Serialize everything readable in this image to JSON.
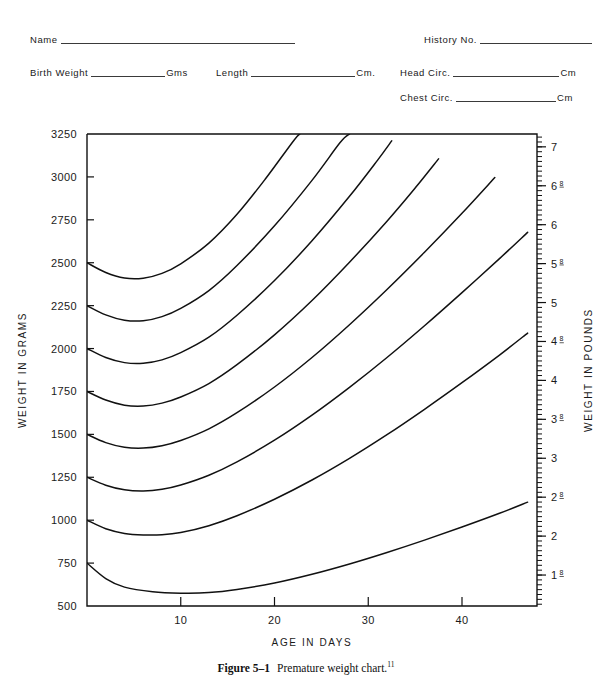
{
  "header_form": {
    "fields": [
      {
        "name": "name",
        "label": "Name",
        "value": "",
        "unit": "",
        "rule_width": 234
      },
      {
        "name": "history-no",
        "label": "History No.",
        "value": "",
        "unit": "",
        "rule_width": 112
      },
      {
        "name": "birth-weight",
        "label": "Birth Weight",
        "value": "",
        "unit": "Gms",
        "rule_width": 74
      },
      {
        "name": "length",
        "label": "Length",
        "value": "",
        "unit": "Cm.",
        "rule_width": 104
      },
      {
        "name": "head-circ",
        "label": "Head Circ.",
        "value": "",
        "unit": "Cm",
        "rule_width": 106
      },
      {
        "name": "chest-circ",
        "label": "Chest Circ.",
        "value": "",
        "unit": "Cm",
        "rule_width": 100
      }
    ]
  },
  "caption": {
    "number": "Figure 5–1",
    "text": "Premature weight chart.",
    "footnote": "11"
  },
  "chart_data": {
    "type": "line",
    "title": "Premature weight chart",
    "xlabel": "AGE IN DAYS",
    "ylabel": "WEIGHT IN GRAMS",
    "y2label": "WEIGHT IN POUNDS",
    "xlim": [
      0,
      48
    ],
    "ylim": [
      500,
      3250
    ],
    "grid": false,
    "legend": "none",
    "xticks": [
      10,
      20,
      30,
      40
    ],
    "xtick_labels": [
      "10",
      "20",
      "30",
      "40"
    ],
    "xtick_minor_step": 2,
    "yticks": [
      500,
      750,
      1000,
      1250,
      1500,
      1750,
      2000,
      2250,
      2500,
      2750,
      3000,
      3250
    ],
    "ytick_labels": [
      "500",
      "750",
      "1000",
      "1250",
      "1500",
      "1750",
      "2000",
      "2250",
      "2500",
      "2750",
      "3000",
      "3250"
    ],
    "y2_ticks_grams": [
      453.6,
      680.4,
      907.2,
      1134,
      1360.8,
      1587.6,
      1814.4,
      2041.2,
      2268,
      2494.8,
      2721.6,
      2948.4,
      3175.2
    ],
    "y2_tick_labels": [
      "1 Lb.",
      "1|8",
      "2",
      "2|8",
      "3",
      "3|8",
      "4",
      "4|8",
      "5",
      "5|8",
      "6",
      "6|8",
      "7"
    ],
    "y2_minor_step_grams": 28.35,
    "series": [
      {
        "name": "birth-weight-750g",
        "birth_weight": 750,
        "points": [
          [
            0,
            750
          ],
          [
            2,
            660
          ],
          [
            4,
            610
          ],
          [
            7,
            583
          ],
          [
            10,
            575
          ],
          [
            13,
            578
          ],
          [
            16,
            596
          ],
          [
            20,
            634
          ],
          [
            24,
            685
          ],
          [
            28,
            745
          ],
          [
            32,
            812
          ],
          [
            36,
            884
          ],
          [
            40,
            960
          ],
          [
            44,
            1040
          ],
          [
            47,
            1105
          ]
        ]
      },
      {
        "name": "birth-weight-1000g",
        "birth_weight": 1000,
        "points": [
          [
            0,
            1000
          ],
          [
            2,
            950
          ],
          [
            4,
            923
          ],
          [
            6,
            914
          ],
          [
            8,
            915
          ],
          [
            10,
            928
          ],
          [
            13,
            968
          ],
          [
            16,
            1026
          ],
          [
            20,
            1122
          ],
          [
            24,
            1234
          ],
          [
            28,
            1360
          ],
          [
            32,
            1498
          ],
          [
            36,
            1646
          ],
          [
            40,
            1801
          ],
          [
            44,
            1962
          ],
          [
            47,
            2090
          ]
        ]
      },
      {
        "name": "birth-weight-1250g",
        "birth_weight": 1250,
        "points": [
          [
            0,
            1250
          ],
          [
            2,
            1204
          ],
          [
            4,
            1177
          ],
          [
            6,
            1170
          ],
          [
            8,
            1180
          ],
          [
            10,
            1205
          ],
          [
            13,
            1262
          ],
          [
            16,
            1340
          ],
          [
            20,
            1466
          ],
          [
            24,
            1612
          ],
          [
            28,
            1774
          ],
          [
            32,
            1948
          ],
          [
            36,
            2133
          ],
          [
            40,
            2326
          ],
          [
            44,
            2524
          ],
          [
            47,
            2677
          ]
        ]
      },
      {
        "name": "birth-weight-1500g",
        "birth_weight": 1500,
        "points": [
          [
            0,
            1500
          ],
          [
            2,
            1452
          ],
          [
            4,
            1425
          ],
          [
            6,
            1420
          ],
          [
            8,
            1434
          ],
          [
            10,
            1464
          ],
          [
            13,
            1532
          ],
          [
            16,
            1626
          ],
          [
            20,
            1776
          ],
          [
            24,
            1948
          ],
          [
            28,
            2139
          ],
          [
            32,
            2344
          ],
          [
            36,
            2561
          ],
          [
            40,
            2788
          ],
          [
            43.5,
            2996
          ]
        ]
      },
      {
        "name": "birth-weight-1750g",
        "birth_weight": 1750,
        "points": [
          [
            0,
            1750
          ],
          [
            2,
            1700
          ],
          [
            4,
            1670
          ],
          [
            6,
            1665
          ],
          [
            8,
            1682
          ],
          [
            10,
            1718
          ],
          [
            13,
            1796
          ],
          [
            16,
            1906
          ],
          [
            20,
            2080
          ],
          [
            24,
            2280
          ],
          [
            28,
            2503
          ],
          [
            32,
            2742
          ],
          [
            35,
            2935
          ],
          [
            37.5,
            3105
          ]
        ]
      },
      {
        "name": "birth-weight-2000g",
        "birth_weight": 2000,
        "points": [
          [
            0,
            2000
          ],
          [
            2,
            1948
          ],
          [
            4,
            1918
          ],
          [
            6,
            1914
          ],
          [
            8,
            1934
          ],
          [
            10,
            1976
          ],
          [
            13,
            2066
          ],
          [
            16,
            2194
          ],
          [
            20,
            2396
          ],
          [
            24,
            2628
          ],
          [
            28,
            2887
          ],
          [
            31,
            3098
          ],
          [
            32.5,
            3210
          ]
        ]
      },
      {
        "name": "birth-weight-2250g",
        "birth_weight": 2250,
        "points": [
          [
            0,
            2250
          ],
          [
            2,
            2196
          ],
          [
            4,
            2165
          ],
          [
            6,
            2162
          ],
          [
            8,
            2186
          ],
          [
            10,
            2234
          ],
          [
            13,
            2338
          ],
          [
            16,
            2484
          ],
          [
            20,
            2715
          ],
          [
            24,
            2980
          ],
          [
            27,
            3200
          ],
          [
            28,
            3250
          ]
        ]
      },
      {
        "name": "birth-weight-2500g",
        "birth_weight": 2500,
        "points": [
          [
            0,
            2500
          ],
          [
            2,
            2443
          ],
          [
            4,
            2411
          ],
          [
            6,
            2410
          ],
          [
            8,
            2438
          ],
          [
            10,
            2494
          ],
          [
            13,
            2614
          ],
          [
            16,
            2782
          ],
          [
            19,
            2986
          ],
          [
            22,
            3208
          ],
          [
            22.7,
            3250
          ]
        ]
      }
    ]
  }
}
